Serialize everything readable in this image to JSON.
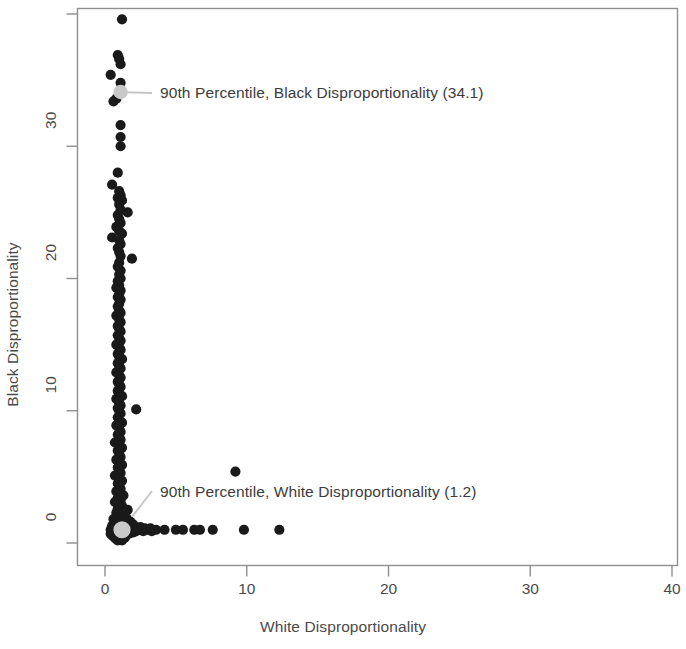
{
  "chart_data": {
    "type": "scatter",
    "title": "",
    "xlabel": "White Disproportionality",
    "ylabel": "Black Disproportionality",
    "xlim": [
      0,
      40
    ],
    "ylim": [
      0,
      40
    ],
    "xticks": [
      0,
      10,
      20,
      30,
      40
    ],
    "yticks": [
      0,
      10,
      20,
      30,
      40
    ],
    "xtick_labels": [
      "0",
      "10",
      "20",
      "30",
      "40"
    ],
    "ytick_labels": [
      "0",
      "10",
      "20",
      "30",
      "40"
    ],
    "grid": false,
    "legend": null,
    "marker_color": "#1a1a1a",
    "highlight_color": "#c9c9c9",
    "frame_color": "#8a8a8a",
    "series": [
      {
        "name": "Districts",
        "marker": "filled-circle",
        "color": "#1a1a1a",
        "points": [
          [
            1.2,
            39.6
          ],
          [
            0.9,
            36.9
          ],
          [
            1.0,
            36.6
          ],
          [
            1.1,
            36.2
          ],
          [
            0.4,
            35.4
          ],
          [
            1.1,
            34.8
          ],
          [
            0.8,
            33.6
          ],
          [
            0.6,
            33.4
          ],
          [
            1.1,
            31.6
          ],
          [
            1.1,
            30.7
          ],
          [
            1.1,
            30.0
          ],
          [
            0.9,
            28.0
          ],
          [
            0.5,
            27.1
          ],
          [
            1.0,
            26.6
          ],
          [
            1.1,
            26.3
          ],
          [
            0.9,
            26.1
          ],
          [
            1.2,
            25.9
          ],
          [
            1.0,
            25.6
          ],
          [
            1.1,
            25.2
          ],
          [
            1.6,
            25.0
          ],
          [
            0.9,
            24.8
          ],
          [
            1.0,
            24.5
          ],
          [
            1.1,
            24.2
          ],
          [
            0.8,
            23.9
          ],
          [
            1.0,
            23.6
          ],
          [
            1.2,
            23.4
          ],
          [
            0.5,
            23.1
          ],
          [
            1.0,
            22.9
          ],
          [
            1.1,
            22.6
          ],
          [
            0.9,
            22.3
          ],
          [
            1.0,
            22.0
          ],
          [
            1.1,
            21.7
          ],
          [
            1.9,
            21.5
          ],
          [
            1.0,
            21.2
          ],
          [
            0.9,
            20.9
          ],
          [
            1.1,
            20.6
          ],
          [
            1.0,
            20.3
          ],
          [
            1.1,
            20.0
          ],
          [
            0.9,
            19.8
          ],
          [
            1.0,
            19.5
          ],
          [
            0.8,
            19.3
          ],
          [
            1.1,
            19.1
          ],
          [
            1.0,
            18.8
          ],
          [
            0.9,
            18.6
          ],
          [
            1.1,
            18.4
          ],
          [
            1.0,
            18.1
          ],
          [
            0.9,
            17.9
          ],
          [
            1.0,
            17.6
          ],
          [
            1.1,
            17.4
          ],
          [
            0.8,
            17.2
          ],
          [
            1.0,
            16.9
          ],
          [
            1.1,
            16.7
          ],
          [
            0.9,
            16.4
          ],
          [
            1.0,
            16.2
          ],
          [
            1.1,
            16.0
          ],
          [
            0.9,
            15.7
          ],
          [
            1.0,
            15.5
          ],
          [
            1.1,
            15.3
          ],
          [
            0.8,
            15.0
          ],
          [
            1.0,
            14.8
          ],
          [
            1.1,
            14.6
          ],
          [
            0.9,
            14.3
          ],
          [
            1.0,
            14.1
          ],
          [
            1.2,
            13.9
          ],
          [
            0.9,
            13.6
          ],
          [
            1.0,
            13.4
          ],
          [
            1.1,
            13.2
          ],
          [
            0.8,
            12.9
          ],
          [
            1.0,
            12.7
          ],
          [
            1.1,
            12.5
          ],
          [
            0.9,
            12.2
          ],
          [
            1.0,
            12.0
          ],
          [
            1.1,
            11.8
          ],
          [
            0.9,
            11.5
          ],
          [
            1.0,
            11.3
          ],
          [
            1.2,
            11.1
          ],
          [
            0.8,
            10.9
          ],
          [
            1.0,
            10.6
          ],
          [
            1.1,
            10.4
          ],
          [
            0.9,
            10.2
          ],
          [
            1.0,
            10.0
          ],
          [
            2.2,
            10.1
          ],
          [
            1.1,
            9.8
          ],
          [
            0.9,
            9.5
          ],
          [
            1.0,
            9.3
          ],
          [
            1.2,
            9.1
          ],
          [
            0.8,
            8.9
          ],
          [
            1.0,
            8.7
          ],
          [
            1.1,
            8.4
          ],
          [
            0.9,
            8.2
          ],
          [
            1.0,
            8.0
          ],
          [
            1.1,
            7.8
          ],
          [
            0.7,
            7.6
          ],
          [
            1.0,
            7.4
          ],
          [
            1.2,
            7.2
          ],
          [
            0.9,
            7.0
          ],
          [
            1.0,
            6.8
          ],
          [
            1.1,
            6.5
          ],
          [
            0.8,
            6.3
          ],
          [
            1.0,
            6.1
          ],
          [
            1.2,
            5.9
          ],
          [
            0.9,
            5.7
          ],
          [
            1.0,
            5.5
          ],
          [
            1.1,
            5.3
          ],
          [
            0.7,
            5.1
          ],
          [
            1.0,
            4.9
          ],
          [
            1.2,
            4.7
          ],
          [
            9.2,
            5.4
          ],
          [
            0.9,
            4.5
          ],
          [
            1.0,
            4.3
          ],
          [
            1.1,
            4.1
          ],
          [
            0.8,
            3.9
          ],
          [
            1.0,
            3.7
          ],
          [
            1.3,
            3.6
          ],
          [
            0.9,
            3.4
          ],
          [
            1.1,
            3.2
          ],
          [
            0.7,
            3.1
          ],
          [
            1.0,
            2.9
          ],
          [
            1.2,
            2.8
          ],
          [
            0.9,
            2.6
          ],
          [
            1.1,
            2.5
          ],
          [
            1.6,
            2.5
          ],
          [
            0.8,
            2.3
          ],
          [
            1.0,
            2.2
          ],
          [
            1.3,
            2.1
          ],
          [
            0.9,
            2.0
          ],
          [
            1.1,
            1.9
          ],
          [
            1.5,
            1.9
          ],
          [
            0.6,
            1.8
          ],
          [
            0.9,
            1.7
          ],
          [
            1.2,
            1.7
          ],
          [
            1.4,
            1.6
          ],
          [
            1.8,
            1.6
          ],
          [
            0.7,
            1.5
          ],
          [
            1.0,
            1.5
          ],
          [
            1.3,
            1.4
          ],
          [
            1.6,
            1.4
          ],
          [
            2.0,
            1.4
          ],
          [
            0.5,
            1.3
          ],
          [
            0.8,
            1.3
          ],
          [
            1.1,
            1.3
          ],
          [
            1.4,
            1.2
          ],
          [
            1.7,
            1.2
          ],
          [
            2.1,
            1.2
          ],
          [
            2.5,
            1.2
          ],
          [
            0.6,
            1.1
          ],
          [
            0.9,
            1.1
          ],
          [
            1.2,
            1.1
          ],
          [
            1.5,
            1.1
          ],
          [
            1.9,
            1.1
          ],
          [
            2.3,
            1.1
          ],
          [
            2.8,
            1.1
          ],
          [
            3.2,
            1.1
          ],
          [
            0.4,
            1.0
          ],
          [
            0.7,
            1.0
          ],
          [
            1.0,
            1.0
          ],
          [
            1.3,
            1.0
          ],
          [
            1.6,
            1.0
          ],
          [
            2.0,
            1.0
          ],
          [
            2.4,
            1.0
          ],
          [
            3.0,
            1.0
          ],
          [
            3.6,
            1.0
          ],
          [
            4.2,
            1.0
          ],
          [
            5.0,
            1.0
          ],
          [
            5.5,
            1.0
          ],
          [
            6.3,
            1.0
          ],
          [
            6.7,
            1.0
          ],
          [
            7.6,
            1.0
          ],
          [
            9.8,
            1.0
          ],
          [
            12.3,
            1.0
          ],
          [
            0.5,
            0.9
          ],
          [
            0.8,
            0.9
          ],
          [
            1.1,
            0.9
          ],
          [
            1.4,
            0.9
          ],
          [
            1.8,
            0.9
          ],
          [
            2.2,
            0.9
          ],
          [
            2.7,
            0.9
          ],
          [
            3.3,
            0.9
          ],
          [
            0.6,
            0.8
          ],
          [
            0.9,
            0.8
          ],
          [
            1.2,
            0.8
          ],
          [
            1.5,
            0.8
          ],
          [
            2.0,
            0.8
          ],
          [
            0.4,
            0.7
          ],
          [
            0.7,
            0.7
          ],
          [
            1.0,
            0.7
          ],
          [
            1.3,
            0.7
          ],
          [
            1.7,
            0.7
          ],
          [
            0.5,
            0.6
          ],
          [
            0.8,
            0.6
          ],
          [
            1.1,
            0.6
          ],
          [
            1.5,
            0.6
          ],
          [
            0.6,
            0.5
          ],
          [
            0.9,
            0.5
          ],
          [
            1.2,
            0.5
          ],
          [
            0.7,
            0.4
          ],
          [
            1.0,
            0.4
          ],
          [
            1.4,
            0.4
          ],
          [
            0.8,
            0.3
          ],
          [
            1.1,
            0.3
          ],
          [
            0.9,
            0.2
          ],
          [
            1.2,
            0.2
          ]
        ]
      }
    ],
    "highlights": [
      {
        "name": "black-90th-percentile",
        "point": [
          1.1,
          34.1
        ],
        "value": 34.1,
        "color": "#c9c9c9",
        "label": "90th Percentile, Black Disproportionality (34.1)"
      },
      {
        "name": "white-90th-percentile",
        "point": [
          1.2,
          1.0
        ],
        "value": 1.2,
        "color": "#c9c9c9",
        "label": "90th Percentile, White Disproportionality (1.2)"
      }
    ],
    "annotations": [
      {
        "text": "90th Percentile, Black Disproportionality (34.1)"
      },
      {
        "text": "90th Percentile, White Disproportionality (1.2)"
      }
    ]
  }
}
